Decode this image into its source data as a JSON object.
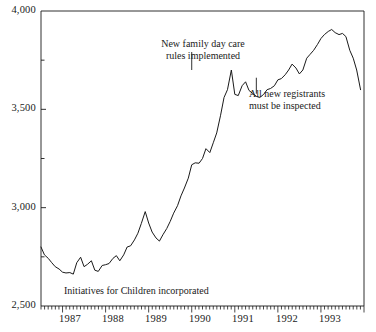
{
  "chart_data": {
    "type": "line",
    "title": "",
    "subtitle": "",
    "xlabel": "",
    "ylabel": "",
    "ylim": [
      2500,
      4000
    ],
    "xlim": [
      1986.5,
      1994.0
    ],
    "grid": false,
    "legend": "none",
    "y_ticks_major": [
      4000,
      3500,
      3000,
      2500
    ],
    "y_ticklabels": [
      "4,000",
      "3,500",
      "3,000",
      "2,500"
    ],
    "y_ticks_minor": [
      3750,
      3250,
      2750
    ],
    "x_ticklabels": [
      "1987",
      "1988",
      "1989",
      "1990",
      "1991",
      "1992",
      "1993"
    ],
    "x_tick_values": [
      1987,
      1988,
      1989,
      1990,
      1991,
      1992,
      1993
    ],
    "x_minor_tick_interval_months": 1,
    "series": [
      {
        "name": "Registered day care places",
        "color": "#1a1a1a",
        "x": [
          1986.5,
          1986.58,
          1986.67,
          1986.75,
          1986.83,
          1986.92,
          1987.0,
          1987.08,
          1987.17,
          1987.25,
          1987.33,
          1987.42,
          1987.5,
          1987.58,
          1987.67,
          1987.75,
          1987.83,
          1987.92,
          1988.0,
          1988.08,
          1988.17,
          1988.25,
          1988.33,
          1988.42,
          1988.5,
          1988.58,
          1988.67,
          1988.75,
          1988.83,
          1988.92,
          1989.0,
          1989.08,
          1989.17,
          1989.25,
          1989.33,
          1989.42,
          1989.5,
          1989.58,
          1989.67,
          1989.75,
          1989.83,
          1989.92,
          1990.0,
          1990.08,
          1990.17,
          1990.25,
          1990.33,
          1990.42,
          1990.5,
          1990.58,
          1990.67,
          1990.75,
          1990.83,
          1990.92,
          1991.0,
          1991.08,
          1991.17,
          1991.25,
          1991.33,
          1991.42,
          1991.5,
          1991.58,
          1991.67,
          1991.75,
          1991.83,
          1991.92,
          1992.0,
          1992.08,
          1992.17,
          1992.25,
          1992.33,
          1992.42,
          1992.5,
          1992.58,
          1992.67,
          1992.75,
          1992.83,
          1992.92,
          1993.0,
          1993.08,
          1993.17,
          1993.25,
          1993.33,
          1993.42,
          1993.5,
          1993.58,
          1993.67,
          1993.75,
          1993.83,
          1993.92
        ],
        "values": [
          2800,
          2760,
          2742,
          2720,
          2700,
          2688,
          2672,
          2668,
          2670,
          2662,
          2720,
          2748,
          2700,
          2712,
          2730,
          2682,
          2676,
          2706,
          2710,
          2716,
          2742,
          2756,
          2730,
          2760,
          2800,
          2806,
          2836,
          2870,
          2920,
          2980,
          2922,
          2876,
          2846,
          2830,
          2862,
          2894,
          2930,
          2972,
          3010,
          3060,
          3100,
          3150,
          3218,
          3228,
          3226,
          3250,
          3300,
          3280,
          3330,
          3380,
          3470,
          3560,
          3600,
          3700,
          3576,
          3570,
          3620,
          3640,
          3596,
          3580,
          3566,
          3560,
          3576,
          3600,
          3606,
          3620,
          3650,
          3656,
          3676,
          3700,
          3730,
          3710,
          3680,
          3700,
          3760,
          3780,
          3800,
          3830,
          3860,
          3880,
          3896,
          3906,
          3890,
          3880,
          3886,
          3870,
          3800,
          3760,
          3700,
          3600
        ]
      }
    ],
    "annotations": [
      {
        "name": "new-family-day-care-rules",
        "lines": [
          "New family day care",
          "rules implemented"
        ],
        "x_point": 1990.0,
        "y_point": 3700
      },
      {
        "name": "all-new-registrants-inspected",
        "lines": [
          "All new registrants",
          "must be inspected"
        ],
        "x_point": 1991.5,
        "y_point": 3620
      },
      {
        "name": "initiatives-for-children-incorporated",
        "lines": [
          "Initiatives for Children incorporated"
        ],
        "x_point": null,
        "y_point": null
      }
    ]
  },
  "axis": {
    "y_labels": [
      {
        "text": "4,000",
        "value": 4000
      },
      {
        "text": "3,500",
        "value": 3500
      },
      {
        "text": "3,000",
        "value": 3000
      },
      {
        "text": "2,500",
        "value": 2500
      }
    ],
    "x_labels": [
      {
        "text": "1987"
      },
      {
        "text": "1988"
      },
      {
        "text": "1989"
      },
      {
        "text": "1990"
      },
      {
        "text": "1991"
      },
      {
        "text": "1992"
      },
      {
        "text": "1993"
      }
    ]
  },
  "annotation_text": {
    "rules_line1": "New family day care",
    "rules_line2": "rules implemented",
    "registrants_line1": "All new registrants",
    "registrants_line2": "must be inspected",
    "initiatives": "Initiatives for Children incorporated"
  },
  "colors": {
    "line": "#1a1a1a",
    "axis": "#1a1a1a",
    "background": "#ffffff"
  }
}
